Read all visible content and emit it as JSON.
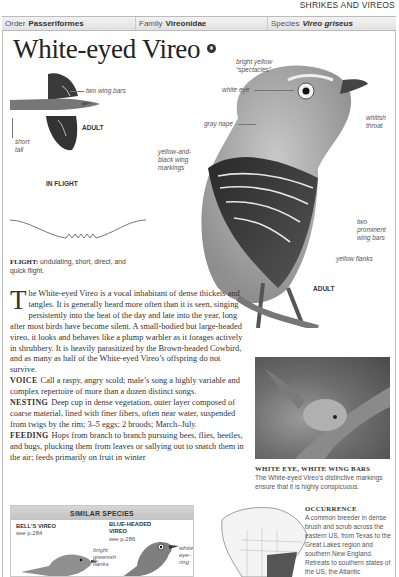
{
  "header": {
    "section": "SHRIKES AND VIREOS",
    "taxonomy": {
      "order_label": "Order",
      "order_value": "Passeriformes",
      "family_label": "Family",
      "family_value": "Vireonidae",
      "species_label": "Species",
      "species_value": "Vireo griseus"
    }
  },
  "title": "White-eyed Vireo",
  "icons": {
    "sound": "sound-icon"
  },
  "flight_illustration": {
    "labels": {
      "wing_bars": "two wing bars",
      "adult": "ADULT",
      "short_tail_1": "short",
      "short_tail_2": "tail"
    },
    "caption": "IN FLIGHT"
  },
  "main_illustration": {
    "labels": {
      "spectacles_1": "bright yellow",
      "spectacles_2": "“spectacles”",
      "white_eye": "white eye",
      "gray_nape": "gray nape",
      "whitish_throat_1": "whitish",
      "whitish_throat_2": "throat",
      "wing_markings_1": "yellow-and-",
      "wing_markings_2": "black wing",
      "wing_markings_3": "markings",
      "wing_bars_1": "two",
      "wing_bars_2": "prominent",
      "wing_bars_3": "wing bars",
      "flanks": "yellow flanks",
      "adult": "ADULT"
    }
  },
  "flight": {
    "label": "FLIGHT:",
    "text": "undulating, short, direct, and quick flight."
  },
  "description": {
    "dropcap": "T",
    "intro": "he White-eyed Vireo is a vocal inhabitant of dense thickets and tangles. It is generally heard more often than it is seen, singing persistently into the heat of the day and late into the year, long after most birds have become silent. A small-bodied but large-headed vireo, it looks and behaves like a plump warbler as it forages actively in shrubbery. It is heavily parasitized by the Brown-headed Cowbird, and as many as half of the White-eyed Vireo’s offspring do not survive.",
    "voice_label": "VOICE",
    "voice": "Call a raspy, angry scold; male’s song a highly variable and complex repertoire of more than a dozen distinct songs.",
    "nesting_label": "NESTING",
    "nesting": "Deep cup in dense vegetation, outer layer composed of coarse material, lined with finer fibers, often near water, suspended from twigs by the rim; 3–5 eggs; 2 broods; March–July.",
    "feeding_label": "FEEDING",
    "feeding": "Hops from branch to branch pursuing bees, flies, beetles, and bugs, plucking them from leaves or sallying out to snatch them in the air; feeds primarily on fruit in winter"
  },
  "photo": {
    "caption_title": "WHITE EYE, WHITE WING BARS",
    "caption_text": "The White-eyed Vireo’s distinctive markings ensure that it is highly conspicuous."
  },
  "similar_species": {
    "heading": "SIMILAR SPECIES",
    "species": [
      {
        "name": "BELL’S VIREO",
        "ref": "see p.284"
      },
      {
        "name_1": "BLUE-HEADED",
        "name_2": "VIREO",
        "ref": "see p.286"
      }
    ],
    "labels": {
      "flanks_1": "bright",
      "flanks_2": "greenish",
      "flanks_3": "flanks",
      "eyering_1": "white",
      "eyering_2": "eye-",
      "eyering_3": "ring"
    }
  },
  "occurrence": {
    "title": "OCCURRENCE",
    "text": "A common breeder in dense brush and scrub across the eastern US, from Texas to the Great Lakes region and southern New England. Retreats to southern states of the US, the Atlantic"
  }
}
